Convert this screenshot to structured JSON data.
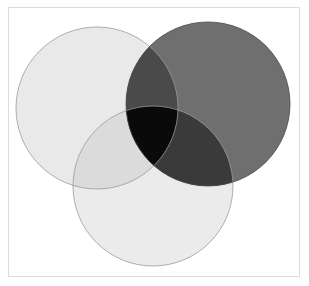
{
  "figure": {
    "title": "Three-set Venn diagram",
    "type": "venn",
    "background_color": "#ffffff",
    "frame": {
      "name": "frame-border",
      "color": "#dcdcdc",
      "width_px": 1,
      "x": 8,
      "y": 7,
      "width": 292,
      "height": 270
    },
    "canvas": {
      "width": 309,
      "height": 286
    }
  },
  "chart_data": {
    "type": "venn",
    "title": "Three-set Venn diagram",
    "set_count": 3,
    "sets": [
      {
        "id": "A",
        "label": "",
        "name": "circle-left",
        "cx": 97,
        "cy": 108,
        "r": 81,
        "fill": "#e9e9e9",
        "stroke": "#9a9a9a",
        "stroke_width": 0.8
      },
      {
        "id": "B",
        "label": "",
        "name": "circle-right",
        "cx": 208,
        "cy": 104,
        "r": 82,
        "fill": "#6f6f6f",
        "stroke": "#4b4b4b",
        "stroke_width": 0.8
      },
      {
        "id": "C",
        "label": "",
        "name": "circle-bottom",
        "cx": 153,
        "cy": 186,
        "r": 80,
        "fill": "#ebebeb",
        "stroke": "#9a9a9a",
        "stroke_width": 0.8
      }
    ],
    "regions": [
      {
        "id": "A",
        "name": "region-left-only",
        "fill": "#e9e9e9"
      },
      {
        "id": "B",
        "name": "region-right-only",
        "fill": "#6f6f6f"
      },
      {
        "id": "C",
        "name": "region-bottom-only",
        "fill": "#ebebeb"
      },
      {
        "id": "AB",
        "name": "region-left-right",
        "fill": "#4a4a4a"
      },
      {
        "id": "AC",
        "name": "region-left-bottom",
        "fill": "#dbdbdb"
      },
      {
        "id": "BC",
        "name": "region-right-bottom",
        "fill": "#3a3a3a"
      },
      {
        "id": "ABC",
        "name": "region-triple-intersection",
        "fill": "#0a0a0a"
      }
    ],
    "legend": {
      "visible": false,
      "position": "none"
    },
    "axis": {
      "visible": false
    },
    "grid": false,
    "annotations": [],
    "labels": []
  }
}
